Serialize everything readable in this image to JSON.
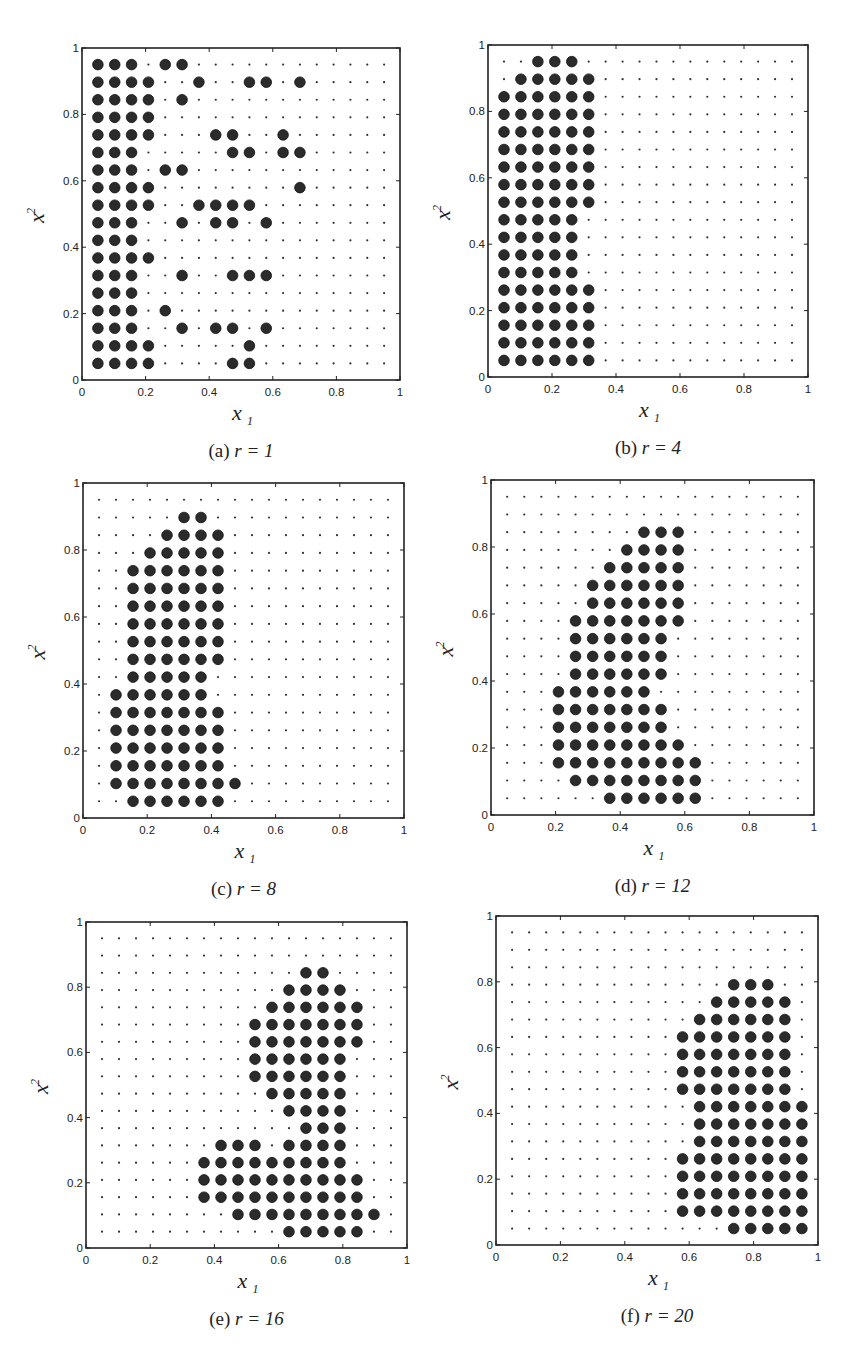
{
  "figure": {
    "grid": {
      "n": 18,
      "min": 0.05,
      "max": 0.95
    },
    "marker_color": "#2b2b2b",
    "small_marker_color": "#333333"
  },
  "chart_data": [
    {
      "type": "scatter",
      "id": "a",
      "caption_letter": "(a)",
      "caption_expr": "r = 1",
      "xlabel": "x1",
      "ylabel": "x2",
      "xlim": [
        0,
        1
      ],
      "ylim": [
        0,
        1
      ],
      "xticks": [
        "0",
        "0.2",
        "0.4",
        "0.6",
        "0.8",
        "1"
      ],
      "yticks": [
        "0",
        "0.2",
        "0.4",
        "0.6",
        "0.8",
        "1"
      ],
      "grid_points": "18x18 uniform grid from 0.05 to 0.95 (small dots); filled points shown as large dots",
      "filled_rows_top_to_bottom_col_indices_1_based": [
        [
          1,
          2,
          3,
          5,
          6
        ],
        [
          1,
          2,
          3,
          4,
          7,
          10,
          11,
          13
        ],
        [
          1,
          2,
          3,
          4,
          6
        ],
        [
          1,
          2,
          3,
          4
        ],
        [
          1,
          2,
          3,
          4,
          8,
          9,
          12
        ],
        [
          1,
          2,
          3,
          9,
          10,
          12,
          13
        ],
        [
          1,
          2,
          3,
          5,
          6
        ],
        [
          1,
          2,
          3,
          4,
          13
        ],
        [
          1,
          2,
          3,
          4,
          7,
          8,
          9,
          10
        ],
        [
          1,
          2,
          3,
          6,
          8,
          9,
          11
        ],
        [
          1,
          2,
          3
        ],
        [
          1,
          2,
          3,
          4
        ],
        [
          1,
          2,
          3,
          6,
          9,
          10,
          11
        ],
        [
          1,
          2,
          3
        ],
        [
          1,
          2,
          3,
          5
        ],
        [
          1,
          2,
          3,
          6,
          8,
          9,
          11
        ],
        [
          1,
          2,
          3,
          4,
          10
        ],
        [
          1,
          2,
          3,
          4,
          9,
          10
        ]
      ],
      "box": {
        "left": 82,
        "top": 48,
        "right": 400,
        "bottom": 380
      }
    },
    {
      "type": "scatter",
      "id": "b",
      "caption_letter": "(b)",
      "caption_expr": "r = 4",
      "xlabel": "x1",
      "ylabel": "x2",
      "xlim": [
        0,
        1
      ],
      "ylim": [
        0,
        1
      ],
      "xticks": [
        "0",
        "0.2",
        "0.4",
        "0.6",
        "0.8",
        "1"
      ],
      "yticks": [
        "0",
        "0.2",
        "0.4",
        "0.6",
        "0.8",
        "1"
      ],
      "filled_rows_top_to_bottom_col_indices_1_based": [
        [
          3,
          4,
          5
        ],
        [
          2,
          3,
          4,
          5,
          6
        ],
        [
          1,
          2,
          3,
          4,
          5,
          6
        ],
        [
          1,
          2,
          3,
          4,
          5,
          6
        ],
        [
          1,
          2,
          3,
          4,
          5,
          6
        ],
        [
          1,
          2,
          3,
          4,
          5,
          6
        ],
        [
          1,
          2,
          3,
          4,
          5,
          6
        ],
        [
          1,
          2,
          3,
          4,
          5,
          6
        ],
        [
          1,
          2,
          3,
          4,
          5,
          6
        ],
        [
          1,
          2,
          3,
          4,
          5
        ],
        [
          1,
          2,
          3,
          4,
          5
        ],
        [
          1,
          2,
          3,
          4,
          5
        ],
        [
          1,
          2,
          3,
          4,
          5
        ],
        [
          1,
          2,
          3,
          4,
          5,
          6
        ],
        [
          1,
          2,
          3,
          4,
          5,
          6
        ],
        [
          1,
          2,
          3,
          4,
          5,
          6
        ],
        [
          1,
          2,
          3,
          4,
          5,
          6
        ],
        [
          1,
          2,
          3,
          4,
          5,
          6
        ]
      ],
      "box": {
        "left": 488,
        "top": 45,
        "right": 808,
        "bottom": 377
      }
    },
    {
      "type": "scatter",
      "id": "c",
      "caption_letter": "(c)",
      "caption_expr": "r = 8",
      "xlabel": "x1",
      "ylabel": "x2",
      "xlim": [
        0,
        1
      ],
      "ylim": [
        0,
        1
      ],
      "xticks": [
        "0",
        "0.2",
        "0.4",
        "0.6",
        "0.8",
        "1"
      ],
      "yticks": [
        "0",
        "0.2",
        "0.4",
        "0.6",
        "0.8",
        "1"
      ],
      "filled_rows_top_to_bottom_col_indices_1_based": [
        [],
        [
          6,
          7
        ],
        [
          5,
          6,
          7,
          8
        ],
        [
          4,
          5,
          6,
          7,
          8
        ],
        [
          3,
          4,
          5,
          6,
          7,
          8
        ],
        [
          3,
          4,
          5,
          6,
          7,
          8
        ],
        [
          3,
          4,
          5,
          6,
          7,
          8
        ],
        [
          3,
          4,
          5,
          6,
          7,
          8
        ],
        [
          3,
          4,
          5,
          6,
          7,
          8
        ],
        [
          3,
          4,
          5,
          6,
          7,
          8
        ],
        [
          3,
          4,
          5,
          6,
          7
        ],
        [
          2,
          3,
          4,
          5,
          6,
          7
        ],
        [
          2,
          3,
          4,
          5,
          6,
          7,
          8
        ],
        [
          2,
          3,
          4,
          5,
          6,
          7,
          8
        ],
        [
          2,
          3,
          4,
          5,
          6,
          7,
          8
        ],
        [
          2,
          3,
          4,
          5,
          6,
          7,
          8
        ],
        [
          2,
          3,
          4,
          5,
          6,
          7,
          8,
          9
        ],
        [
          3,
          4,
          5,
          6,
          7,
          8
        ]
      ],
      "box": {
        "left": 83,
        "top": 483,
        "right": 404,
        "bottom": 818
      }
    },
    {
      "type": "scatter",
      "id": "d",
      "caption_letter": "(d)",
      "caption_expr": "r = 12",
      "xlabel": "x1",
      "ylabel": "x2",
      "xlim": [
        0,
        1
      ],
      "ylim": [
        0,
        1
      ],
      "xticks": [
        "0",
        "0.2",
        "0.4",
        "0.6",
        "0.8",
        "1"
      ],
      "yticks": [
        "0",
        "0.2",
        "0.4",
        "0.6",
        "0.8",
        "1"
      ],
      "filled_rows_top_to_bottom_col_indices_1_based": [
        [],
        [],
        [
          9,
          10,
          11
        ],
        [
          8,
          9,
          10,
          11
        ],
        [
          7,
          8,
          9,
          10,
          11
        ],
        [
          6,
          7,
          8,
          9,
          10,
          11
        ],
        [
          6,
          7,
          8,
          9,
          10,
          11
        ],
        [
          5,
          6,
          7,
          8,
          9,
          10,
          11
        ],
        [
          5,
          6,
          7,
          8,
          9,
          10
        ],
        [
          5,
          6,
          7,
          8,
          9,
          10
        ],
        [
          5,
          6,
          7,
          8,
          9,
          10
        ],
        [
          4,
          5,
          6,
          7,
          8,
          9
        ],
        [
          4,
          5,
          6,
          7,
          8,
          9,
          10
        ],
        [
          4,
          5,
          6,
          7,
          8,
          9,
          10
        ],
        [
          4,
          5,
          6,
          7,
          8,
          9,
          10,
          11
        ],
        [
          4,
          5,
          6,
          7,
          8,
          9,
          10,
          11,
          12
        ],
        [
          5,
          6,
          7,
          8,
          9,
          10,
          11,
          12
        ],
        [
          7,
          8,
          9,
          10,
          11,
          12
        ]
      ],
      "box": {
        "left": 491,
        "top": 480,
        "right": 814,
        "bottom": 815
      }
    },
    {
      "type": "scatter",
      "id": "e",
      "caption_letter": "(e)",
      "caption_expr": "r = 16",
      "xlabel": "x1",
      "ylabel": "x2",
      "xlim": [
        0,
        1
      ],
      "ylim": [
        0,
        1
      ],
      "xticks": [
        "0",
        "0.2",
        "0.4",
        "0.6",
        "0.8",
        "1"
      ],
      "yticks": [
        "0",
        "0.2",
        "0.4",
        "0.6",
        "0.8",
        "1"
      ],
      "filled_rows_top_to_bottom_col_indices_1_based": [
        [],
        [],
        [
          13,
          14
        ],
        [
          12,
          13,
          14,
          15
        ],
        [
          11,
          12,
          13,
          14,
          15,
          16
        ],
        [
          10,
          11,
          12,
          13,
          14,
          15,
          16
        ],
        [
          10,
          11,
          12,
          13,
          14,
          15,
          16
        ],
        [
          10,
          11,
          12,
          13,
          14,
          15
        ],
        [
          10,
          11,
          12,
          13,
          14,
          15
        ],
        [
          11,
          12,
          13,
          14,
          15
        ],
        [
          12,
          13,
          14,
          15
        ],
        [
          13,
          14,
          15
        ],
        [
          8,
          9,
          10,
          12,
          13,
          14,
          15
        ],
        [
          7,
          8,
          9,
          10,
          11,
          12,
          13,
          14,
          15
        ],
        [
          7,
          8,
          9,
          10,
          11,
          12,
          13,
          14,
          15,
          16
        ],
        [
          7,
          8,
          9,
          10,
          11,
          12,
          13,
          14,
          15,
          16
        ],
        [
          9,
          10,
          11,
          12,
          13,
          14,
          15,
          16,
          17
        ],
        [
          12,
          13,
          14,
          15,
          16
        ]
      ],
      "box": {
        "left": 86,
        "top": 922,
        "right": 407,
        "bottom": 1248
      }
    },
    {
      "type": "scatter",
      "id": "f",
      "caption_letter": "(f)",
      "caption_expr": "r = 20",
      "xlabel": "x1",
      "ylabel": "x2",
      "xlim": [
        0,
        1
      ],
      "ylim": [
        0,
        1
      ],
      "xticks": [
        "0",
        "0.2",
        "0.4",
        "0.6",
        "0.8",
        "1"
      ],
      "yticks": [
        "0",
        "0.2",
        "0.4",
        "0.6",
        "0.8",
        "1"
      ],
      "filled_rows_top_to_bottom_col_indices_1_based": [
        [],
        [],
        [],
        [
          14,
          15,
          16
        ],
        [
          13,
          14,
          15,
          16,
          17
        ],
        [
          12,
          13,
          14,
          15,
          16,
          17
        ],
        [
          11,
          12,
          13,
          14,
          15,
          16,
          17
        ],
        [
          11,
          12,
          13,
          14,
          15,
          16,
          17
        ],
        [
          11,
          12,
          13,
          14,
          15,
          16,
          17
        ],
        [
          11,
          12,
          13,
          14,
          15,
          16,
          17
        ],
        [
          12,
          13,
          14,
          15,
          16,
          17,
          18
        ],
        [
          12,
          13,
          14,
          15,
          16,
          17,
          18
        ],
        [
          12,
          13,
          14,
          15,
          16,
          17,
          18
        ],
        [
          11,
          12,
          13,
          14,
          15,
          16,
          17,
          18
        ],
        [
          11,
          12,
          13,
          14,
          15,
          16,
          17,
          18
        ],
        [
          11,
          12,
          13,
          14,
          15,
          16,
          17,
          18
        ],
        [
          11,
          12,
          13,
          14,
          15,
          16,
          17,
          18
        ],
        [
          14,
          15,
          16,
          17,
          18
        ]
      ],
      "box": {
        "left": 496,
        "top": 916,
        "right": 818,
        "bottom": 1245
      }
    }
  ]
}
